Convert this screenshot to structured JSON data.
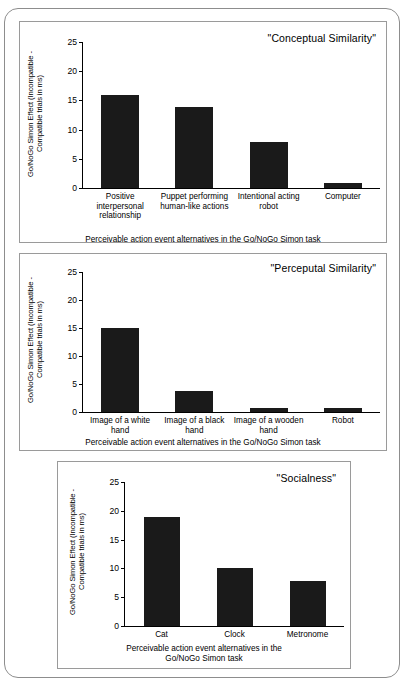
{
  "figure": {
    "axis_y_label": "Go/NoGo Simon Effect (Incompatible -\nCompatible trials in ms)",
    "axis_x_label": "Perceivable action event alternatives in the Go/NoGo Simon task",
    "axis_x_label_wrapped": "Perceivable action event alternatives in the\nGo/NoGo Simon task",
    "y_ticks": [
      "25",
      "20",
      "15",
      "10",
      "5",
      "0"
    ],
    "bar_color": "#1a1a1a",
    "frame_color": "#8d8d8d"
  },
  "chart_data": [
    {
      "type": "bar",
      "title": "\"Conceptual Similarity\"",
      "categories": [
        "Positive\ninterpersonal\nrelationship",
        "Puppet performing\nhuman-like actions",
        "Intentional acting\nrobot",
        "Computer"
      ],
      "values": [
        16.0,
        13.9,
        7.8,
        0.8
      ],
      "xlabel": "Perceivable action event alternatives in the Go/NoGo Simon task",
      "ylabel": "Go/NoGo Simon Effect (Incompatible - Compatible trials in ms)",
      "ylim": [
        0,
        25
      ],
      "yticks": [
        0,
        5,
        10,
        15,
        20,
        25
      ],
      "grid": false,
      "legend": "none"
    },
    {
      "type": "bar",
      "title": "\"Perceputal Similarity\"",
      "categories": [
        "Image of a white\nhand",
        "Image of a black\nhand",
        "Image of a wooden\nhand",
        "Robot"
      ],
      "values": [
        15.0,
        3.8,
        0.8,
        0.7
      ],
      "xlabel": "Perceivable action event alternatives in the Go/NoGo Simon task",
      "ylabel": "Go/NoGo Simon Effect (Incompatible - Compatible trials in ms)",
      "ylim": [
        0,
        25
      ],
      "yticks": [
        0,
        5,
        10,
        15,
        20,
        25
      ],
      "grid": false,
      "legend": "none"
    },
    {
      "type": "bar",
      "title": "\"Socialness\"",
      "categories": [
        "Cat",
        "Clock",
        "Metronome"
      ],
      "values": [
        19.0,
        10.0,
        7.8
      ],
      "xlabel": "Perceivable action event alternatives in the Go/NoGo Simon task",
      "ylabel": "Go/NoGo Simon Effect (Incompatible - Compatible trials in ms)",
      "ylim": [
        0,
        25
      ],
      "yticks": [
        0,
        5,
        10,
        15,
        20,
        25
      ],
      "grid": false,
      "legend": "none"
    }
  ]
}
